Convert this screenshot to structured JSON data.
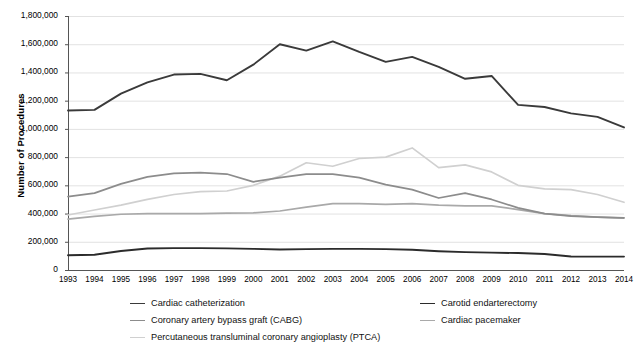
{
  "chart_data": {
    "type": "line",
    "title": "",
    "xlabel": "",
    "ylabel": "Number of Procedures",
    "categories": [
      1993,
      1994,
      1995,
      1996,
      1997,
      1998,
      1999,
      2000,
      2001,
      2002,
      2003,
      2004,
      2005,
      2006,
      2007,
      2008,
      2009,
      2010,
      2011,
      2012,
      2013,
      2014
    ],
    "ylim": [
      0,
      1800000
    ],
    "ytick_step": 200000,
    "ytick_labels": [
      "1,800,000",
      "1,600,000",
      "1,400,000",
      "1,200,000",
      "1,000,000",
      "800,000",
      "600,000",
      "400,000",
      "200,000",
      "0"
    ],
    "xtick_labels": [
      "1993",
      "1994",
      "1995",
      "1996",
      "1997",
      "1998",
      "1999",
      "2000",
      "2001",
      "2002",
      "2003",
      "2004",
      "2005",
      "2006",
      "2007",
      "2008",
      "2009",
      "2010",
      "2011",
      "2012",
      "2013",
      "2014"
    ],
    "grid": true,
    "legend_position": "bottom",
    "series": [
      {
        "name": "Cardiac catheterization",
        "color": "#3a3a3a",
        "width": 1.9,
        "values": [
          1130000,
          1135000,
          1250000,
          1330000,
          1385000,
          1390000,
          1345000,
          1455000,
          1600000,
          1555000,
          1620000,
          1545000,
          1475000,
          1510000,
          1440000,
          1355000,
          1375000,
          1170000,
          1155000,
          1110000,
          1085000,
          1010000
        ]
      },
      {
        "name": "Carotid endarterectomy",
        "color": "#2b2b2b",
        "width": 1.9,
        "values": [
          105000,
          108000,
          135000,
          152000,
          155000,
          155000,
          153000,
          150000,
          145000,
          148000,
          150000,
          150000,
          148000,
          143000,
          133000,
          127000,
          123000,
          120000,
          113000,
          96000,
          95000,
          95000
        ]
      },
      {
        "name": "Coronary artery bypass graft (CABG)",
        "color": "#8c8c8c",
        "width": 1.7,
        "values": [
          520000,
          545000,
          610000,
          660000,
          685000,
          690000,
          680000,
          625000,
          655000,
          680000,
          680000,
          655000,
          605000,
          570000,
          510000,
          545000,
          500000,
          440000,
          400000,
          382000,
          375000,
          370000
        ]
      },
      {
        "name": "Cardiac pacemaker",
        "color": "#a9a9a9",
        "width": 1.7,
        "values": [
          360000,
          380000,
          395000,
          400000,
          400000,
          400000,
          403000,
          405000,
          418000,
          445000,
          470000,
          470000,
          465000,
          470000,
          460000,
          455000,
          455000,
          428000,
          400000,
          385000,
          375000,
          368000
        ]
      },
      {
        "name": "Percutaneous transluminal coronary angioplasty (PTCA)",
        "color": "#d0d0d0",
        "width": 1.7,
        "values": [
          390000,
          425000,
          460000,
          500000,
          535000,
          555000,
          560000,
          600000,
          665000,
          760000,
          735000,
          790000,
          800000,
          865000,
          725000,
          745000,
          695000,
          600000,
          575000,
          570000,
          535000,
          480000
        ]
      }
    ]
  },
  "legend": {
    "entries": [
      {
        "label": "Cardiac catheterization",
        "color": "#3a3a3a",
        "col": 0,
        "row": 0
      },
      {
        "label": "Carotid endarterectomy",
        "color": "#2b2b2b",
        "col": 1,
        "row": 0
      },
      {
        "label": "Coronary artery bypass graft (CABG)",
        "color": "#8c8c8c",
        "col": 0,
        "row": 1
      },
      {
        "label": "Cardiac pacemaker",
        "color": "#a9a9a9",
        "col": 1,
        "row": 1
      },
      {
        "label": "Percutaneous transluminal coronary angioplasty (PTCA)",
        "color": "#d0d0d0",
        "col": 0,
        "row": 2
      }
    ]
  },
  "axes": {
    "y_title": "Number of Procedures",
    "grid_color": "#e2e2e2",
    "axis_color": "#555555"
  }
}
